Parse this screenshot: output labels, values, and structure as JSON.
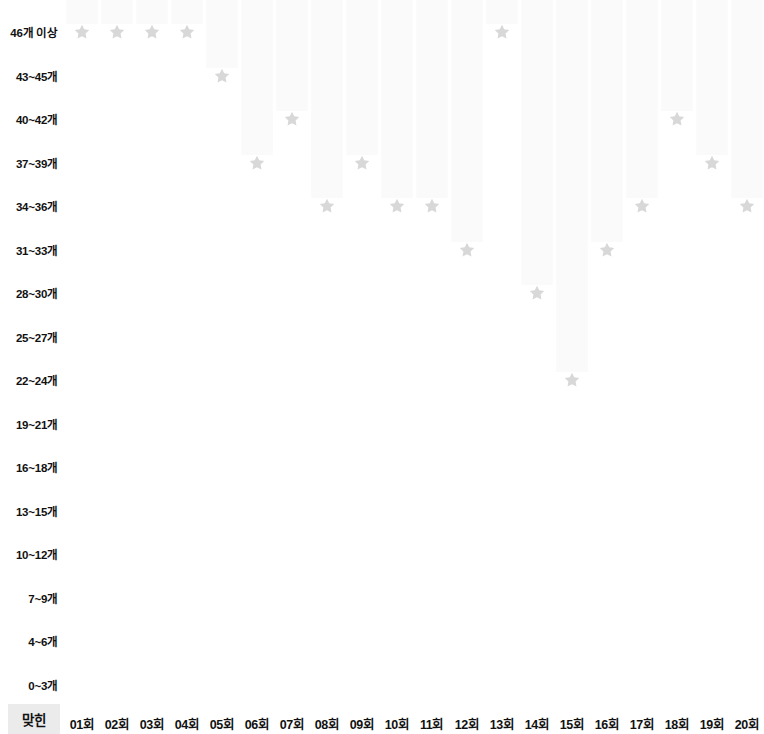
{
  "chart_data": {
    "type": "scatter",
    "title": "",
    "subtitle": "",
    "xlabel": "맞힌",
    "ylabel": "",
    "grid": false,
    "legend": null,
    "marker": "star",
    "marker_color": "#d8d8d8",
    "bar_color": "#fafafa",
    "categories": [
      "01회",
      "02회",
      "03회",
      "04회",
      "05회",
      "06회",
      "07회",
      "08회",
      "09회",
      "10회",
      "11회",
      "12회",
      "13회",
      "14회",
      "15회",
      "16회",
      "17회",
      "18회",
      "19회",
      "20회"
    ],
    "y_categories": [
      "46개 이상",
      "43~45개",
      "40~42개",
      "37~39개",
      "34~36개",
      "31~33개",
      "28~30개",
      "25~27개",
      "22~24개",
      "19~21개",
      "16~18개",
      "13~15개",
      "10~12개",
      "7~9개",
      "4~6개",
      "0~3개"
    ],
    "values": [
      "46개 이상",
      "46개 이상",
      "46개 이상",
      "46개 이상",
      "43~45개",
      "37~39개",
      "40~42개",
      "34~36개",
      "37~39개",
      "34~36개",
      "34~36개",
      "31~33개",
      "46개 이상",
      "28~30개",
      "22~24개",
      "31~33개",
      "34~36개",
      "40~42개",
      "37~39개",
      "34~36개"
    ],
    "value_indices": [
      0,
      0,
      0,
      0,
      1,
      3,
      2,
      4,
      3,
      4,
      4,
      5,
      0,
      6,
      8,
      5,
      4,
      2,
      3,
      4
    ]
  },
  "axis": {
    "corner_label": "맞힌"
  }
}
